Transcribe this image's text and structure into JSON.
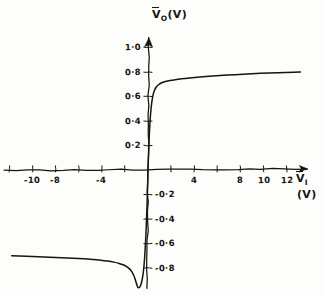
{
  "chart_data": {
    "type": "line",
    "title": "",
    "subtitle": "",
    "xlabel": "V_I (V)",
    "ylabel": "V_O (V)",
    "xlim": [
      -12,
      14
    ],
    "ylim": [
      -0.95,
      1.1
    ],
    "grid": false,
    "legend": null,
    "hand_drawn": true,
    "xticks": [
      -12,
      -10,
      -8,
      -6,
      -4,
      -2,
      0,
      2,
      4,
      6,
      8,
      10,
      12
    ],
    "xtick_labels": [
      "",
      "-10",
      "-8",
      "",
      "-4",
      "",
      "",
      "",
      "4",
      "",
      "8",
      "10",
      "12"
    ],
    "yticks": [
      1.0,
      0.8,
      0.6,
      0.4,
      0.2,
      -0.2,
      -0.4,
      -0.6,
      -0.8
    ],
    "ytick_labels": [
      "1·0",
      "0·8",
      "0·6",
      "0·4",
      "0·2",
      "-0·2",
      "-0·4",
      "-0·6",
      "-0·8"
    ],
    "series": [
      {
        "name": "transfer characteristic",
        "color": "#15150f",
        "points": [
          [
            -11.8,
            -0.7
          ],
          [
            -11.0,
            -0.703
          ],
          [
            -10.0,
            -0.707
          ],
          [
            -9.0,
            -0.71
          ],
          [
            -8.0,
            -0.714
          ],
          [
            -7.0,
            -0.718
          ],
          [
            -6.0,
            -0.722
          ],
          [
            -5.2,
            -0.727
          ],
          [
            -4.4,
            -0.733
          ],
          [
            -3.8,
            -0.739
          ],
          [
            -3.2,
            -0.747
          ],
          [
            -2.7,
            -0.757
          ],
          [
            -2.3,
            -0.768
          ],
          [
            -2.0,
            -0.78
          ],
          [
            -1.75,
            -0.795
          ],
          [
            -1.55,
            -0.812
          ],
          [
            -1.4,
            -0.83
          ],
          [
            -1.28,
            -0.85
          ],
          [
            -1.18,
            -0.872
          ],
          [
            -1.1,
            -0.896
          ],
          [
            -1.02,
            -0.92
          ],
          [
            -0.94,
            -0.945
          ],
          [
            -0.85,
            -0.962
          ],
          [
            -0.72,
            -0.96
          ],
          [
            -0.58,
            -0.93
          ],
          [
            -0.45,
            -0.87
          ],
          [
            -0.34,
            -0.78
          ],
          [
            -0.25,
            -0.66
          ],
          [
            -0.17,
            -0.51
          ],
          [
            -0.1,
            -0.34
          ],
          [
            -0.04,
            -0.16
          ],
          [
            0.0,
            0.0
          ],
          [
            0.06,
            0.17
          ],
          [
            0.13,
            0.33
          ],
          [
            0.22,
            0.46
          ],
          [
            0.33,
            0.56
          ],
          [
            0.46,
            0.625
          ],
          [
            0.62,
            0.665
          ],
          [
            0.82,
            0.69
          ],
          [
            1.05,
            0.706
          ],
          [
            1.35,
            0.718
          ],
          [
            1.7,
            0.727
          ],
          [
            2.1,
            0.734
          ],
          [
            2.6,
            0.741
          ],
          [
            3.2,
            0.748
          ],
          [
            4.0,
            0.755
          ],
          [
            5.0,
            0.763
          ],
          [
            6.2,
            0.771
          ],
          [
            7.5,
            0.779
          ],
          [
            9.0,
            0.786
          ],
          [
            10.5,
            0.792
          ],
          [
            12.0,
            0.797
          ],
          [
            13.2,
            0.8
          ]
        ]
      }
    ]
  },
  "axes": {
    "y_axis_label_main": "V",
    "y_axis_label_sub": "O",
    "y_axis_label_unit": "(V)",
    "x_axis_label_main": "V",
    "x_axis_label_sub": "I",
    "x_axis_label_unit": "(V)"
  },
  "ticks": {
    "x": [
      {
        "value": -10,
        "label": "-10"
      },
      {
        "value": -8,
        "label": "-8"
      },
      {
        "value": -4,
        "label": "-4"
      },
      {
        "value": 4,
        "label": "4"
      },
      {
        "value": 8,
        "label": "8"
      },
      {
        "value": 10,
        "label": "10"
      },
      {
        "value": 12,
        "label": "12"
      }
    ],
    "y": [
      {
        "value": 1.0,
        "label": "1·0"
      },
      {
        "value": 0.8,
        "label": "0·8"
      },
      {
        "value": 0.6,
        "label": "0·6"
      },
      {
        "value": 0.4,
        "label": "0·4"
      },
      {
        "value": 0.2,
        "label": "0·2"
      },
      {
        "value": -0.2,
        "label": "-0·2"
      },
      {
        "value": -0.4,
        "label": "-0·4"
      },
      {
        "value": -0.6,
        "label": "-0·6"
      },
      {
        "value": -0.8,
        "label": "-0·8"
      }
    ]
  },
  "style": {
    "ink": "#15150f",
    "paper": "#fdfdfc"
  }
}
